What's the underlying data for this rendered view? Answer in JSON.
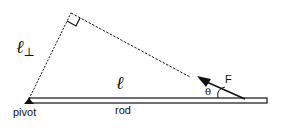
{
  "diagram": {
    "labels": {
      "l_perp": "ℓ",
      "perp_sub": "⊥",
      "l": "ℓ",
      "force": "F",
      "theta": "θ",
      "pivot": "pivot",
      "rod": "rod"
    },
    "colors": {
      "line": "#111111",
      "background": "#ffffff"
    }
  }
}
